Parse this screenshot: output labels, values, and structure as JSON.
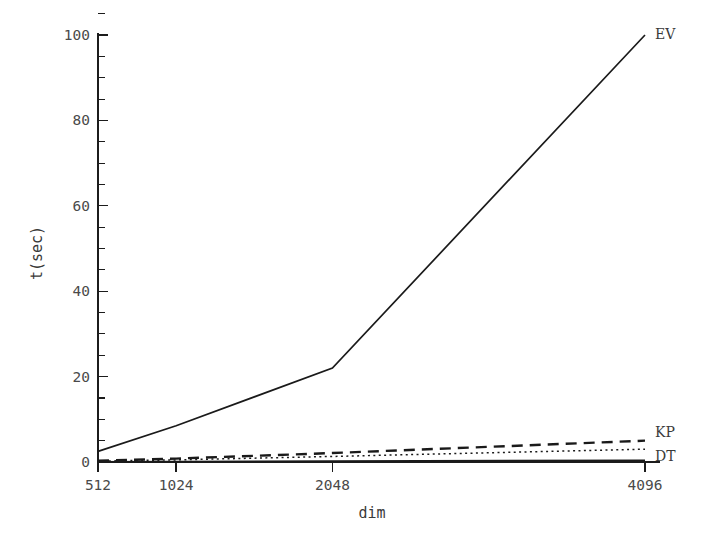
{
  "chart_data": {
    "type": "line",
    "title": "",
    "subtitle": "",
    "xlabel": "dim",
    "ylabel": "t(sec)",
    "x": [
      512,
      1024,
      2048,
      4096
    ],
    "xtick_labels": [
      "512",
      "1024",
      "2048",
      "4096"
    ],
    "xlim": [
      512,
      4096
    ],
    "ylim": [
      0,
      103
    ],
    "ytick_labels": [
      "0",
      "20",
      "40",
      "60",
      "80",
      "100"
    ],
    "ytick_values": [
      0,
      20,
      40,
      60,
      80,
      100
    ],
    "yminor_step": 5,
    "grid": false,
    "legend_position": "inline-right-of-line-end",
    "series": [
      {
        "name": "EV",
        "label": "EV",
        "style": "solid",
        "color": "#1a1a1a",
        "values": [
          2.5,
          8.5,
          22.0,
          100.0
        ]
      },
      {
        "name": "KP",
        "label": "KP",
        "style": "dashed",
        "color": "#1a1a1a",
        "values": [
          0.3,
          0.8,
          2.1,
          5.0
        ]
      },
      {
        "name": "DT",
        "label": "DT",
        "style": "dotted",
        "color": "#1a1a1a",
        "values": [
          0.2,
          0.5,
          1.3,
          3.0
        ]
      },
      {
        "name": "baseline",
        "label": "",
        "style": "solid",
        "color": "#1a1a1a",
        "values": [
          0.05,
          0.1,
          0.2,
          0.4
        ]
      }
    ]
  },
  "axes": {
    "y_axis_name": "t(sec)",
    "x_axis_name": "dim"
  }
}
